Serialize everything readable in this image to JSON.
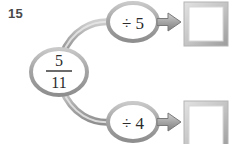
{
  "problem": {
    "number": "15"
  },
  "diagram": {
    "type": "function-machine-flow",
    "input_node": {
      "name": "input-fraction",
      "numerator": "5",
      "denominator": "11",
      "display": "5/11"
    },
    "branches": [
      {
        "operation_label": "÷ 5",
        "operation_symbol": "÷",
        "operand": "5",
        "answer_box_value": "",
        "answer_box_placeholder": ""
      },
      {
        "operation_label": "÷ 4",
        "operation_symbol": "÷",
        "operand": "4",
        "answer_box_value": "",
        "answer_box_placeholder": ""
      }
    ],
    "colors": {
      "outline": "#9a9a9a",
      "outline_light": "#c8c8c8",
      "arrow_fill": "#a8a8a8",
      "arrow_edge": "#6e6e6e",
      "box_border": "#bdbdbd",
      "box_shadow": "#8f8f8f",
      "box_fill": "#ffffff",
      "text": "#2b2b2b",
      "number_text": "#4a4a4a",
      "background": "#ffffff"
    }
  }
}
